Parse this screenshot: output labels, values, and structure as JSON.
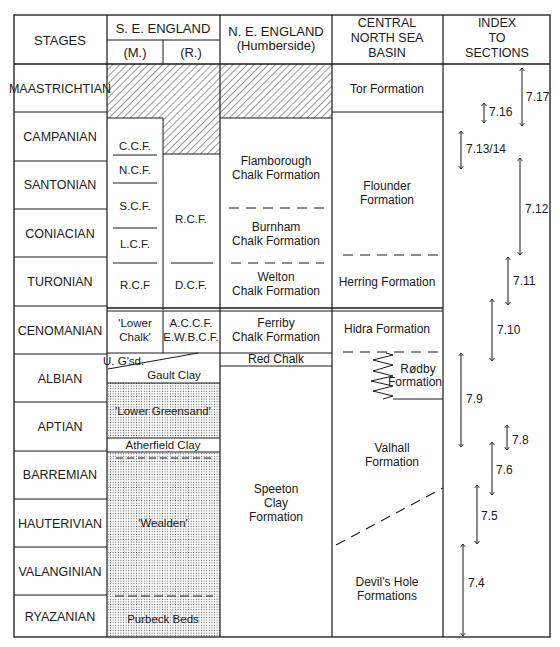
{
  "page": {
    "corner_mark": ""
  },
  "header": {
    "stages": "STAGES",
    "se_england": "S. E. ENGLAND",
    "se_m": "(M.)",
    "se_r": "(R.)",
    "ne_england_1": "N. E. ENGLAND",
    "ne_england_2": "(Humberside)",
    "cns_1": "CENTRAL",
    "cns_2": "NORTH SEA",
    "cns_3": "BASIN",
    "index_1": "INDEX",
    "index_2": "TO",
    "index_3": "SECTIONS"
  },
  "stages": [
    "MAASTRICHTIAN",
    "CAMPANIAN",
    "SANTONIAN",
    "CONIACIAN",
    "TURONIAN",
    "CENOMANIAN",
    "ALBIAN",
    "APTIAN",
    "BARREMIAN",
    "HAUTERIVIAN",
    "VALANGINIAN",
    "RYAZANIAN"
  ],
  "se_m": {
    "ccf": "C.C.F.",
    "ncf": "N.C.F.",
    "scf": "S.C.F.",
    "lcf": "L.C.F.",
    "rcf": "R.C.F",
    "lower_chalk_1": "'Lower",
    "lower_chalk_2": "Chalk'",
    "ugsd": "U. G'sd.",
    "gault": "Gault Clay",
    "lower_greensand": "'Lower Greensand'",
    "atherfield": "Atherfield Clay",
    "wealden": "'Wealden'",
    "purbeck": "Purbeck Beds"
  },
  "se_r": {
    "rcf": "R.C.F.",
    "dcf": "D.C.F.",
    "accf": "A.C.C.F.",
    "ewbcf": "E.W.B.C.F."
  },
  "ne": {
    "flamborough_1": "Flamborough",
    "flamborough_2": "Chalk Formation",
    "burnham_1": "Burnham",
    "burnham_2": "Chalk Formation",
    "welton_1": "Welton",
    "welton_2": "Chalk Formation",
    "ferriby_1": "Ferriby",
    "ferriby_2": "Chalk Formation",
    "red_chalk": "Red Chalk",
    "speeton_1": "Speeton",
    "speeton_2": "Clay",
    "speeton_3": "Formation"
  },
  "cns": {
    "tor": "Tor Formation",
    "flounder_1": "Flounder",
    "flounder_2": "Formation",
    "herring": "Herring Formation",
    "hidra": "Hidra Formation",
    "rodby_1": "Rødby",
    "rodby_2": "Formation",
    "valhall_1": "Valhall",
    "valhall_2": "Formation",
    "devils_1": "Devil's Hole",
    "devils_2": "Formations"
  },
  "index": [
    {
      "label": "7.17",
      "x": 522,
      "y1": 66,
      "y2": 128
    },
    {
      "label": "7.16",
      "x": 484,
      "y1": 102,
      "y2": 124
    },
    {
      "label": "7.13/14",
      "x": 461,
      "y1": 130,
      "y2": 170
    },
    {
      "label": "7.12",
      "x": 520,
      "y1": 157,
      "y2": 256
    },
    {
      "label": "7.11",
      "x": 508,
      "y1": 256,
      "y2": 306
    },
    {
      "label": "7.10",
      "x": 492,
      "y1": 298,
      "y2": 362
    },
    {
      "label": "7.9",
      "x": 461,
      "y1": 352,
      "y2": 448
    },
    {
      "label": "7.8",
      "x": 507,
      "y1": 424,
      "y2": 451
    },
    {
      "label": "7.6",
      "x": 492,
      "y1": 441,
      "y2": 496
    },
    {
      "label": "7.5",
      "x": 477,
      "y1": 484,
      "y2": 545
    },
    {
      "label": "7.4",
      "x": 463,
      "y1": 543,
      "y2": 637
    }
  ]
}
